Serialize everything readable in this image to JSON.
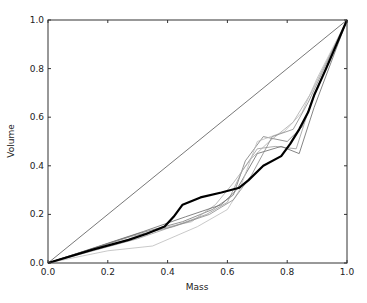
{
  "chart_data": {
    "type": "line",
    "title": "",
    "xlabel": "Mass",
    "ylabel": "Volume",
    "xlim": [
      0.0,
      1.0
    ],
    "ylim": [
      0.0,
      1.0
    ],
    "xticks": [
      "0.0",
      "0.2",
      "0.4",
      "0.6",
      "0.8",
      "1.0"
    ],
    "yticks": [
      "0.0",
      "0.2",
      "0.4",
      "0.6",
      "0.8",
      "1.0"
    ],
    "grid": false,
    "legend": null,
    "series": [
      {
        "name": "reference-diagonal",
        "color": "#555555",
        "width": 0.8,
        "x": [
          0.0,
          1.0
        ],
        "y": [
          0.0,
          1.0
        ]
      },
      {
        "name": "main",
        "color": "#000000",
        "width": 2.2,
        "x": [
          0.0,
          0.15,
          0.27,
          0.33,
          0.39,
          0.42,
          0.45,
          0.51,
          0.58,
          0.64,
          0.67,
          0.72,
          0.78,
          0.81,
          0.84,
          0.87,
          0.89,
          0.93,
          1.0
        ],
        "y": [
          0.0,
          0.055,
          0.095,
          0.12,
          0.15,
          0.19,
          0.24,
          0.27,
          0.29,
          0.31,
          0.34,
          0.4,
          0.44,
          0.49,
          0.55,
          0.62,
          0.69,
          0.8,
          1.0
        ]
      },
      {
        "name": "sample-1",
        "color": "#777777",
        "width": 0.8,
        "x": [
          0.0,
          0.3,
          0.45,
          0.55,
          0.62,
          0.66,
          0.72,
          0.8,
          0.85,
          0.9,
          1.0
        ],
        "y": [
          0.0,
          0.12,
          0.17,
          0.22,
          0.28,
          0.42,
          0.52,
          0.5,
          0.56,
          0.72,
          1.0
        ]
      },
      {
        "name": "sample-2",
        "color": "#999999",
        "width": 0.8,
        "x": [
          0.0,
          0.3,
          0.44,
          0.53,
          0.6,
          0.65,
          0.7,
          0.76,
          0.83,
          0.88,
          1.0
        ],
        "y": [
          0.0,
          0.1,
          0.16,
          0.2,
          0.25,
          0.38,
          0.47,
          0.48,
          0.47,
          0.66,
          1.0
        ]
      },
      {
        "name": "sample-3",
        "color": "#aaaaaa",
        "width": 0.8,
        "x": [
          0.0,
          0.25,
          0.37,
          0.48,
          0.56,
          0.62,
          0.68,
          0.74,
          0.82,
          0.88,
          1.0
        ],
        "y": [
          0.0,
          0.09,
          0.14,
          0.17,
          0.24,
          0.33,
          0.43,
          0.5,
          0.58,
          0.7,
          1.0
        ]
      },
      {
        "name": "sample-4",
        "color": "#666666",
        "width": 0.8,
        "x": [
          0.0,
          0.32,
          0.46,
          0.58,
          0.63,
          0.7,
          0.78,
          0.84,
          0.89,
          1.0
        ],
        "y": [
          0.0,
          0.13,
          0.19,
          0.24,
          0.3,
          0.45,
          0.48,
          0.45,
          0.64,
          1.0
        ]
      },
      {
        "name": "sample-5",
        "color": "#bbbbbb",
        "width": 0.8,
        "x": [
          0.0,
          0.2,
          0.35,
          0.5,
          0.6,
          0.64,
          0.7,
          0.79,
          0.85,
          0.9,
          1.0
        ],
        "y": [
          0.0,
          0.05,
          0.07,
          0.15,
          0.22,
          0.3,
          0.5,
          0.54,
          0.62,
          0.76,
          1.0
        ]
      },
      {
        "name": "sample-6",
        "color": "#888888",
        "width": 0.8,
        "x": [
          0.0,
          0.28,
          0.42,
          0.54,
          0.62,
          0.68,
          0.75,
          0.82,
          0.87,
          1.0
        ],
        "y": [
          0.0,
          0.11,
          0.15,
          0.2,
          0.26,
          0.36,
          0.52,
          0.55,
          0.66,
          1.0
        ]
      }
    ]
  }
}
